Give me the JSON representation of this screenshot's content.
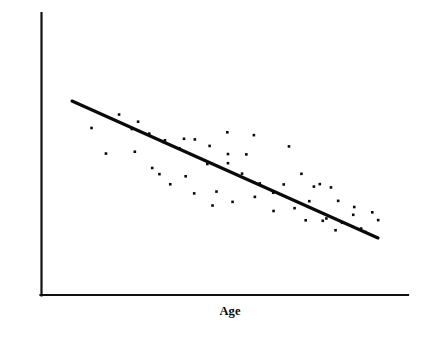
{
  "chart_data": {
    "type": "scatter",
    "title": "",
    "subtitle": "",
    "xlabel": "Age",
    "ylabel": "Rate of healing",
    "xlim": [
      0,
      100
    ],
    "ylim": [
      0,
      100
    ],
    "grid": false,
    "legend": null,
    "axis_ticks": {
      "x_ticks": [],
      "y_ticks": [],
      "x_ticklabels": [],
      "y_ticklabels": [],
      "note": "No numeric tick marks or tick labels are drawn; axes are unlabeled conceptual axes."
    },
    "annotations": [],
    "series": [
      {
        "name": "Observations",
        "type": "scatter",
        "marker": "square-dot",
        "color": "#0a0a0a",
        "points": [
          [
            9.0,
            73.5
          ],
          [
            17.4,
            81.6
          ],
          [
            13.4,
            58.1
          ],
          [
            23.2,
            77.3
          ],
          [
            21.3,
            72.9
          ],
          [
            26.6,
            70.1
          ],
          [
            22.2,
            59.2
          ],
          [
            31.4,
            66.1
          ],
          [
            27.5,
            49.4
          ],
          [
            30.9,
            65.1
          ],
          [
            37.2,
            67.0
          ],
          [
            35.8,
            61.3
          ],
          [
            40.5,
            66.6
          ],
          [
            29.7,
            45.7
          ],
          [
            33.0,
            39.6
          ],
          [
            37.7,
            44.4
          ],
          [
            45.0,
            62.7
          ],
          [
            44.3,
            51.8
          ],
          [
            40.3,
            34.1
          ],
          [
            50.6,
            52.3
          ],
          [
            47.1,
            35.2
          ],
          [
            54.9,
            46.0
          ],
          [
            50.4,
            70.9
          ],
          [
            58.5,
            69.2
          ],
          [
            50.6,
            57.8
          ],
          [
            56.2,
            57.6
          ],
          [
            45.9,
            26.8
          ],
          [
            52.0,
            29.0
          ],
          [
            60.3,
            40.1
          ],
          [
            58.8,
            32.0
          ],
          [
            64.4,
            34.5
          ],
          [
            67.6,
            39.5
          ],
          [
            69.2,
            62.4
          ],
          [
            73.0,
            45.9
          ],
          [
            70.9,
            25.2
          ],
          [
            64.5,
            23.5
          ],
          [
            75.4,
            29.4
          ],
          [
            78.6,
            39.7
          ],
          [
            76.8,
            38.2
          ],
          [
            82.0,
            37.7
          ],
          [
            84.2,
            29.6
          ],
          [
            80.6,
            19.0
          ],
          [
            74.3,
            17.9
          ],
          [
            79.5,
            17.6
          ],
          [
            85.4,
            16.4
          ],
          [
            88.8,
            21.2
          ],
          [
            83.4,
            11.9
          ],
          [
            91.2,
            12.9
          ],
          [
            89.1,
            25.9
          ],
          [
            94.6,
            22.7
          ],
          [
            92.6,
            10.8
          ],
          [
            96.4,
            18.0
          ]
        ]
      },
      {
        "name": "Trend line",
        "type": "line",
        "color": "#0a0a0a",
        "from": [
          8.5,
          75.5
        ],
        "to": [
          92.0,
          22.0
        ],
        "description": "Negative linear trend: rate of healing decreases as age increases."
      }
    ]
  },
  "axes": {
    "y_label": "Rate of healing",
    "x_label": "Age"
  },
  "colors": {
    "ink": "#0a0a0a",
    "axis": "#111111",
    "background": "#ffffff"
  }
}
